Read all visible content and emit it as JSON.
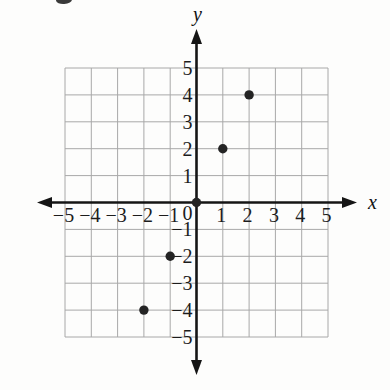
{
  "chart_data": {
    "type": "scatter",
    "title": "",
    "xlabel": "x",
    "ylabel": "y",
    "xlim": [
      -5,
      5
    ],
    "ylim": [
      -5,
      5
    ],
    "grid": true,
    "legend": false,
    "x_ticks": [
      -5,
      -4,
      -3,
      -2,
      -1,
      1,
      2,
      3,
      4,
      5
    ],
    "y_ticks": [
      -5,
      -4,
      -3,
      -2,
      -1,
      1,
      2,
      3,
      4,
      5
    ],
    "origin_label": "0",
    "points": [
      {
        "x": -2,
        "y": -4
      },
      {
        "x": -1,
        "y": -2
      },
      {
        "x": 0,
        "y": 0
      },
      {
        "x": 1,
        "y": 2
      },
      {
        "x": 2,
        "y": 4
      }
    ],
    "colors": {
      "background": "#fdfdfc",
      "grid": "#a8a8a8",
      "axis": "#151515",
      "point": "#242424",
      "label": "#1c1c1c"
    }
  },
  "artifacts": {
    "top_left_ink_mark": true
  }
}
